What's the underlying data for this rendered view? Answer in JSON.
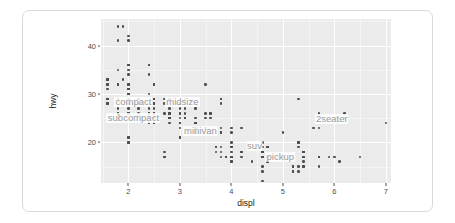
{
  "figure": {
    "panel_bg": "#ebebeb",
    "grid_color": "#ffffff",
    "point_color": "#4d4d4d",
    "label_color": "#9a9a9a",
    "frame_color": "#d9d9d9"
  },
  "axes": {
    "x_label": "displ",
    "y_label": "hwy",
    "x_ticks": [
      "2",
      "3",
      "4",
      "5",
      "6",
      "7"
    ],
    "y_ticks": [
      "40",
      "30",
      "20"
    ]
  },
  "chart_data": {
    "type": "scatter",
    "title": "",
    "subtitle": "",
    "xlabel": "displ",
    "ylabel": "hwy",
    "xlim": [
      1.47,
      7.1
    ],
    "ylim": [
      11.6,
      45.5
    ],
    "x_ticks": [
      2,
      3,
      4,
      5,
      6,
      7
    ],
    "y_ticks": [
      40,
      30,
      20
    ],
    "x_minor_ticks": [
      1.5,
      2.5,
      3.5,
      4.5,
      5.5,
      6.5,
      7.0
    ],
    "y_minor_ticks": [
      45,
      35,
      25,
      15
    ],
    "grid": true,
    "legend_position": "none",
    "point_color": "#4d4d4d",
    "annotations": [
      {
        "text": "compact",
        "x": 2.1,
        "y": 28.3
      },
      {
        "text": "midsize",
        "x": 3.05,
        "y": 28.3
      },
      {
        "text": "subcompact",
        "x": 2.1,
        "y": 25.0
      },
      {
        "text": "minivan",
        "x": 3.4,
        "y": 22.4
      },
      {
        "text": "suv",
        "x": 4.45,
        "y": 19.3
      },
      {
        "text": "pickup",
        "x": 4.95,
        "y": 17.0
      },
      {
        "text": "2seater",
        "x": 5.95,
        "y": 24.8
      }
    ],
    "points": [
      [
        1.8,
        29
      ],
      [
        1.8,
        29
      ],
      [
        2.0,
        31
      ],
      [
        2.0,
        30
      ],
      [
        2.8,
        26
      ],
      [
        2.8,
        26
      ],
      [
        3.1,
        27
      ],
      [
        1.8,
        26
      ],
      [
        1.8,
        25
      ],
      [
        2.0,
        28
      ],
      [
        2.0,
        27
      ],
      [
        2.8,
        25
      ],
      [
        2.8,
        25
      ],
      [
        3.1,
        25
      ],
      [
        3.1,
        25
      ],
      [
        2.8,
        24
      ],
      [
        3.1,
        25
      ],
      [
        4.2,
        23
      ],
      [
        5.3,
        20
      ],
      [
        5.3,
        15
      ],
      [
        5.3,
        20
      ],
      [
        5.7,
        17
      ],
      [
        6.0,
        17
      ],
      [
        5.7,
        26
      ],
      [
        5.7,
        23
      ],
      [
        6.2,
        26
      ],
      [
        6.2,
        25
      ],
      [
        7.0,
        24
      ],
      [
        5.3,
        19
      ],
      [
        5.3,
        14
      ],
      [
        5.7,
        15
      ],
      [
        6.5,
        17
      ],
      [
        2.4,
        27
      ],
      [
        2.4,
        30
      ],
      [
        3.1,
        26
      ],
      [
        3.5,
        23
      ],
      [
        3.6,
        26
      ],
      [
        2.4,
        26
      ],
      [
        3.0,
        25
      ],
      [
        3.3,
        24
      ],
      [
        3.3,
        25
      ],
      [
        3.3,
        24
      ],
      [
        3.3,
        24
      ],
      [
        3.3,
        22
      ],
      [
        3.8,
        23
      ],
      [
        3.8,
        22
      ],
      [
        3.8,
        22
      ],
      [
        4.0,
        23
      ],
      [
        3.7,
        19
      ],
      [
        3.7,
        18
      ],
      [
        3.9,
        17
      ],
      [
        3.9,
        17
      ],
      [
        4.7,
        16
      ],
      [
        4.7,
        16
      ],
      [
        4.7,
        17
      ],
      [
        5.2,
        15
      ],
      [
        5.2,
        14
      ],
      [
        3.9,
        17
      ],
      [
        4.7,
        16
      ],
      [
        4.7,
        16
      ],
      [
        4.7,
        17
      ],
      [
        5.2,
        15
      ],
      [
        5.7,
        17
      ],
      [
        5.9,
        17
      ],
      [
        4.7,
        16
      ],
      [
        4.7,
        16
      ],
      [
        4.7,
        17
      ],
      [
        5.2,
        15
      ],
      [
        5.2,
        14
      ],
      [
        1.6,
        33
      ],
      [
        1.6,
        33
      ],
      [
        1.6,
        32
      ],
      [
        1.6,
        32
      ],
      [
        1.6,
        31
      ],
      [
        1.8,
        26
      ],
      [
        1.8,
        27
      ],
      [
        2.0,
        26
      ],
      [
        2.4,
        25
      ],
      [
        2.4,
        25
      ],
      [
        2.5,
        24
      ],
      [
        2.5,
        25
      ],
      [
        3.3,
        23
      ],
      [
        2.0,
        20
      ],
      [
        2.0,
        21
      ],
      [
        2.0,
        20
      ],
      [
        2.0,
        21
      ],
      [
        2.7,
        17
      ],
      [
        2.7,
        18
      ],
      [
        2.7,
        17
      ],
      [
        3.0,
        23
      ],
      [
        3.7,
        19
      ],
      [
        4.0,
        19
      ],
      [
        4.7,
        19
      ],
      [
        4.7,
        19
      ],
      [
        4.7,
        19
      ],
      [
        5.7,
        17
      ],
      [
        6.1,
        16
      ],
      [
        4.0,
        17
      ],
      [
        4.2,
        17
      ],
      [
        4.4,
        16
      ],
      [
        4.6,
        17
      ],
      [
        5.4,
        17
      ],
      [
        5.4,
        18
      ],
      [
        4.0,
        17
      ],
      [
        4.0,
        19
      ],
      [
        4.6,
        17
      ],
      [
        5.0,
        17
      ],
      [
        4.2,
        18
      ],
      [
        4.2,
        18
      ],
      [
        4.6,
        18
      ],
      [
        4.6,
        18
      ],
      [
        4.6,
        20
      ],
      [
        5.4,
        18
      ],
      [
        5.4,
        18
      ],
      [
        3.8,
        17
      ],
      [
        3.8,
        18
      ],
      [
        4.0,
        17
      ],
      [
        4.0,
        18
      ],
      [
        4.6,
        17
      ],
      [
        4.6,
        18
      ],
      [
        5.4,
        15
      ],
      [
        1.6,
        33
      ],
      [
        1.6,
        33
      ],
      [
        1.8,
        32
      ],
      [
        1.8,
        32
      ],
      [
        1.8,
        29
      ],
      [
        2.0,
        32
      ],
      [
        2.4,
        34
      ],
      [
        2.4,
        36
      ],
      [
        2.4,
        36
      ],
      [
        2.5,
        29
      ],
      [
        2.5,
        26
      ],
      [
        3.3,
        27
      ],
      [
        2.0,
        30
      ],
      [
        2.0,
        31
      ],
      [
        2.0,
        26
      ],
      [
        2.0,
        26
      ],
      [
        2.7,
        28
      ],
      [
        2.7,
        26
      ],
      [
        2.7,
        29
      ],
      [
        3.0,
        28
      ],
      [
        3.0,
        27
      ],
      [
        3.0,
        24
      ],
      [
        3.3,
        24
      ],
      [
        3.3,
        24
      ],
      [
        3.8,
        22
      ],
      [
        3.8,
        19
      ],
      [
        4.0,
        20
      ],
      [
        4.0,
        17
      ],
      [
        4.6,
        12
      ],
      [
        4.6,
        19
      ],
      [
        4.6,
        18
      ],
      [
        4.6,
        14
      ],
      [
        4.6,
        15
      ],
      [
        5.4,
        18
      ],
      [
        5.4,
        18
      ],
      [
        5.4,
        15
      ],
      [
        5.4,
        17
      ],
      [
        5.4,
        16
      ],
      [
        5.4,
        18
      ],
      [
        4.0,
        16
      ],
      [
        4.0,
        16
      ],
      [
        4.6,
        17
      ],
      [
        5.0,
        22
      ],
      [
        2.4,
        24
      ],
      [
        2.4,
        24
      ],
      [
        2.5,
        26
      ],
      [
        2.5,
        25
      ],
      [
        3.5,
        26
      ],
      [
        3.5,
        25
      ],
      [
        3.0,
        24
      ],
      [
        3.0,
        21
      ],
      [
        3.3,
        22
      ],
      [
        3.3,
        23
      ],
      [
        4.0,
        22
      ],
      [
        5.6,
        23
      ],
      [
        3.1,
        29
      ],
      [
        3.8,
        29
      ],
      [
        3.8,
        29
      ],
      [
        3.8,
        28
      ],
      [
        5.3,
        29
      ],
      [
        2.5,
        29
      ],
      [
        2.5,
        29
      ],
      [
        2.5,
        28
      ],
      [
        2.5,
        29
      ],
      [
        2.5,
        27
      ],
      [
        2.5,
        24
      ],
      [
        2.5,
        24
      ],
      [
        2.5,
        26
      ],
      [
        2.2,
        26
      ],
      [
        2.2,
        27
      ],
      [
        2.4,
        26
      ],
      [
        2.4,
        25
      ],
      [
        3.0,
        24
      ],
      [
        3.0,
        21
      ],
      [
        3.5,
        32
      ],
      [
        2.2,
        28
      ],
      [
        2.2,
        29
      ],
      [
        2.4,
        26
      ],
      [
        2.4,
        26
      ],
      [
        3.0,
        26
      ],
      [
        3.0,
        26
      ],
      [
        3.3,
        24
      ],
      [
        1.8,
        35
      ],
      [
        1.8,
        44
      ],
      [
        1.8,
        41
      ],
      [
        1.8,
        29
      ],
      [
        1.8,
        26
      ],
      [
        1.6,
        28
      ],
      [
        1.6,
        29
      ],
      [
        1.6,
        29
      ],
      [
        1.6,
        29
      ],
      [
        1.6,
        28
      ],
      [
        2.2,
        29
      ],
      [
        2.2,
        29
      ],
      [
        2.5,
        26
      ],
      [
        2.5,
        26
      ],
      [
        2.5,
        26
      ],
      [
        2.5,
        26
      ],
      [
        2.5,
        25
      ],
      [
        2.8,
        25
      ],
      [
        2.8,
        25
      ],
      [
        2.0,
        32
      ],
      [
        2.0,
        36
      ],
      [
        2.0,
        36
      ],
      [
        2.0,
        36
      ],
      [
        2.8,
        26
      ],
      [
        2.8,
        26
      ],
      [
        2.0,
        31
      ],
      [
        2.0,
        30
      ],
      [
        2.8,
        26
      ],
      [
        2.8,
        26
      ],
      [
        2.8,
        27
      ],
      [
        2.8,
        26
      ],
      [
        3.6,
        25
      ],
      [
        2.5,
        24
      ],
      [
        2.5,
        25
      ],
      [
        2.5,
        26
      ],
      [
        2.5,
        26
      ],
      [
        1.9,
        44
      ],
      [
        2.0,
        41
      ],
      [
        2.0,
        29
      ],
      [
        2.5,
        26
      ],
      [
        2.5,
        28
      ],
      [
        2.8,
        29
      ],
      [
        2.8,
        29
      ],
      [
        1.9,
        33
      ],
      [
        2.0,
        34
      ],
      [
        2.0,
        42
      ],
      [
        2.0,
        35
      ],
      [
        2.5,
        32
      ],
      [
        2.5,
        32
      ],
      [
        2.8,
        29
      ],
      [
        2.8,
        29
      ],
      [
        3.6,
        26
      ]
    ]
  }
}
